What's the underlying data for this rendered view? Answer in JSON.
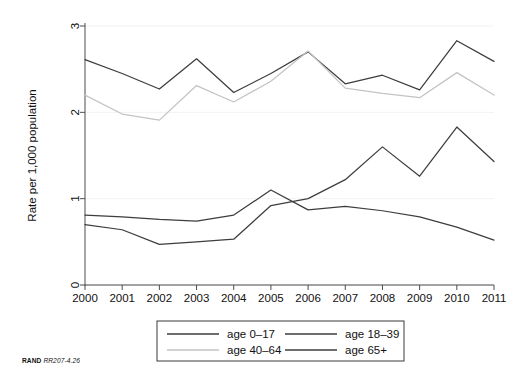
{
  "credit": {
    "org": "RAND",
    "figure_number": "RR207-4.26"
  },
  "axes": {
    "ylabel": "Rate per 1,000 population",
    "xlabel": "",
    "yticks": [
      "0",
      "1",
      "2",
      "3"
    ],
    "xticks": [
      "2000",
      "2001",
      "2002",
      "2003",
      "2004",
      "2005",
      "2006",
      "2007",
      "2008",
      "2009",
      "2010",
      "2011"
    ]
  },
  "legend": {
    "entries": [
      {
        "label": "age 0–17",
        "color": "#3d3d3d"
      },
      {
        "label": "age 18–39",
        "color": "#3d3d3d"
      },
      {
        "label": "age 40–64",
        "color": "#c3c3c3"
      },
      {
        "label": "age 65+",
        "color": "#3d3d3d"
      }
    ]
  },
  "chart_data": {
    "type": "line",
    "title": "",
    "xlabel": "",
    "ylabel": "Rate per 1,000 population",
    "x": [
      2000,
      2001,
      2002,
      2003,
      2004,
      2005,
      2006,
      2007,
      2008,
      2009,
      2010,
      2011
    ],
    "xlim": [
      2000,
      2011
    ],
    "ylim": [
      0,
      3
    ],
    "grid": true,
    "legend_position": "below-center",
    "series": [
      {
        "name": "age 0–17",
        "color": "#3d3d3d",
        "values": [
          2.61,
          2.45,
          2.27,
          2.62,
          2.23,
          2.45,
          2.7,
          2.33,
          2.43,
          2.26,
          2.83,
          2.59
        ]
      },
      {
        "name": "age 18–39",
        "color": "#3d3d3d",
        "values": [
          0.7,
          0.64,
          0.47,
          0.5,
          0.53,
          0.92,
          1.0,
          1.22,
          1.6,
          1.26,
          1.83,
          1.43
        ]
      },
      {
        "name": "age 40–64",
        "color": "#c3c3c3",
        "values": [
          2.2,
          1.98,
          1.91,
          2.31,
          2.12,
          2.36,
          2.71,
          2.28,
          2.22,
          2.17,
          2.46,
          2.2
        ]
      },
      {
        "name": "age 65+",
        "color": "#3d3d3d",
        "values": [
          0.81,
          0.79,
          0.76,
          0.74,
          0.81,
          1.1,
          0.87,
          0.91,
          0.86,
          0.79,
          0.67,
          0.52
        ]
      }
    ]
  }
}
